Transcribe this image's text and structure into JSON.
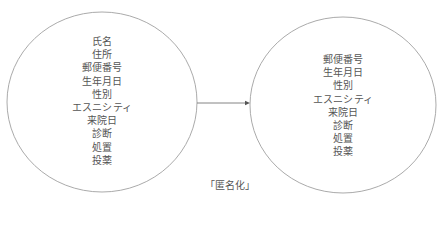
{
  "diagram": {
    "caption": "「匿名化」",
    "source_set": {
      "items": [
        "氏名",
        "住所",
        "郵便番号",
        "生年月日",
        "性別",
        "エスニシティ",
        "来院日",
        "診断",
        "処置",
        "投薬"
      ]
    },
    "target_set": {
      "items": [
        "郵便番号",
        "生年月日",
        "性別",
        "エスニシティ",
        "来院日",
        "診断",
        "処置",
        "投薬"
      ]
    },
    "colors": {
      "stroke": "#9a9a9a",
      "arrow": "#777777",
      "text": "#555555"
    }
  }
}
